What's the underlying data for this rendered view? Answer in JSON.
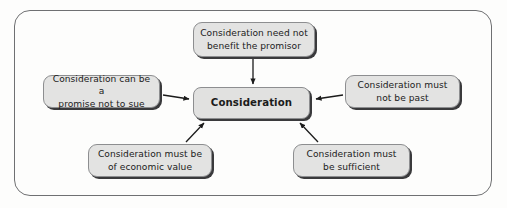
{
  "diagram": {
    "title": "Consideration",
    "frame": {
      "border_color": "#6f7072",
      "background_color": "#fdfdfc"
    },
    "node_style": {
      "fill_color": "#e3e3e2",
      "border_color": "#8d8e90",
      "shadow_color": "#3a3a3c",
      "text_color": "#1b1b1b"
    },
    "center_node": {
      "id": "consideration",
      "label": "Consideration"
    },
    "nodes": [
      {
        "id": "need-not-benefit-promisor",
        "position": "top",
        "label": "Consideration need not\nbenefit the promisor"
      },
      {
        "id": "promise-not-to-sue",
        "position": "left",
        "label": "Consideration can be a\npromise not to sue"
      },
      {
        "id": "must-not-be-past",
        "position": "right",
        "label": "Consideration must\nnot be past"
      },
      {
        "id": "must-be-of-economic-value",
        "position": "bottom-left",
        "label": "Consideration must be\nof economic value"
      },
      {
        "id": "must-be-sufficient",
        "position": "bottom-right",
        "label": "Consideration must\nbe sufficient"
      }
    ],
    "edges": [
      {
        "from": "need-not-benefit-promisor",
        "to": "consideration",
        "direction": "down"
      },
      {
        "from": "promise-not-to-sue",
        "to": "consideration",
        "direction": "right"
      },
      {
        "from": "must-not-be-past",
        "to": "consideration",
        "direction": "left"
      },
      {
        "from": "must-be-of-economic-value",
        "to": "consideration",
        "direction": "up-right"
      },
      {
        "from": "must-be-sufficient",
        "to": "consideration",
        "direction": "up-left"
      }
    ]
  }
}
